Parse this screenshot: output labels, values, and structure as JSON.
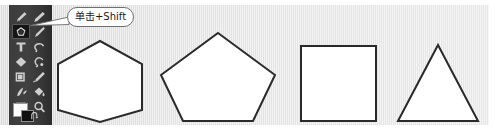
{
  "app": {
    "kind": "image-editor-screenshot",
    "canvas_background_color": "#e4e4e4",
    "toolbar_background_color": "#3c3c3c"
  },
  "callout": {
    "text": "单击+Shift",
    "border_color": "#6e6e6e",
    "background_color": "#ffffff",
    "text_color": "#1a1a1a",
    "points_to": "shape-tool"
  },
  "toolbar": {
    "name": "tools-panel",
    "selected_tool": "shape-tool",
    "tools": [
      {
        "id": "brush-tool",
        "label": "画笔工具",
        "row": 0,
        "col": 0,
        "selected": false
      },
      {
        "id": "pencil-tool",
        "label": "铅笔工具",
        "row": 0,
        "col": 1,
        "selected": false
      },
      {
        "id": "shape-tool",
        "label": "形状工具",
        "row": 1,
        "col": 0,
        "selected": true
      },
      {
        "id": "eyedropper-tool",
        "label": "吸管工具",
        "row": 1,
        "col": 1,
        "selected": false
      },
      {
        "id": "type-tool",
        "label": "文字工具",
        "row": 2,
        "col": 0,
        "selected": false
      },
      {
        "id": "lasso-tool",
        "label": "套索工具",
        "row": 2,
        "col": 1,
        "selected": false
      },
      {
        "id": "gradient-tool",
        "label": "渐变工具",
        "row": 3,
        "col": 0,
        "selected": false
      },
      {
        "id": "stamp-tool",
        "label": "图章工具",
        "row": 3,
        "col": 1,
        "selected": false
      },
      {
        "id": "crop-tool",
        "label": "裁剪工具",
        "row": 4,
        "col": 0,
        "selected": false
      },
      {
        "id": "paintbrush-tool",
        "label": "喷枪工具",
        "row": 4,
        "col": 1,
        "selected": false
      },
      {
        "id": "blur-tool",
        "label": "模糊工具",
        "row": 5,
        "col": 0,
        "selected": false
      },
      {
        "id": "bucket-tool",
        "label": "油漆桶工具",
        "row": 5,
        "col": 1,
        "selected": false
      },
      {
        "id": "frame-tool",
        "label": "画框工具",
        "row": 6,
        "col": 0,
        "selected": false
      },
      {
        "id": "zoom-tool",
        "label": "缩放工具",
        "row": 6,
        "col": 1,
        "selected": false
      }
    ],
    "swatches": {
      "foreground_label": "前景色",
      "foreground_color": "#ffffff",
      "background_label": "背景色",
      "background_color": "#111111",
      "reset_label": "默认前景色和背景色"
    }
  },
  "canvas": {
    "name": "drawing-canvas",
    "stroke_color": "#2a2a2a",
    "fill_color": "#ffffff",
    "shapes": [
      {
        "id": "hexagon",
        "label": "六边形",
        "sides": 6,
        "points": "100,41 142,64 142,110 100,122 58,110 58,64"
      },
      {
        "id": "pentagon",
        "label": "五边形",
        "sides": 5,
        "points": "218,33 275,75 253,121 183,121 161,75"
      },
      {
        "id": "square",
        "label": "正方形",
        "sides": 4,
        "points": "301,46 376,46 376,121 301,121"
      },
      {
        "id": "triangle",
        "label": "三角形",
        "sides": 3,
        "points": "438,45 478,121 398,121"
      }
    ]
  }
}
